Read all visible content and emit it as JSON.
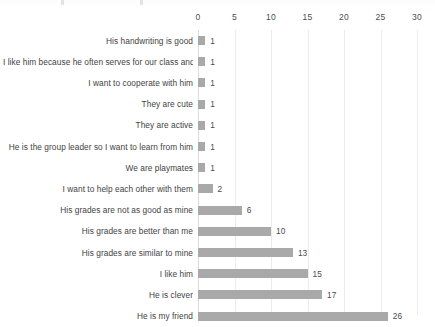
{
  "chart_data": {
    "type": "bar",
    "orientation": "horizontal",
    "title": "",
    "xlabel": "",
    "ylabel": "",
    "xlim": [
      0,
      30
    ],
    "xticks": [
      0,
      5,
      10,
      15,
      20,
      25,
      30
    ],
    "grid": true,
    "legend": false,
    "bar_color": "#a9a9a9",
    "categories": [
      "His handwriting is good",
      "I like him because he often serves for our class and…",
      "I want to cooperate with him",
      "They are cute",
      "They are active",
      "He is the group leader so I want to learn from him",
      "We are playmates",
      "I want to help each other with them",
      "His grades are not as good as mine",
      "His grades are better than me",
      "His grades are  similar to mine",
      "I like him",
      "He is clever",
      "He is my friend"
    ],
    "values": [
      1,
      1,
      1,
      1,
      1,
      1,
      1,
      2,
      6,
      10,
      13,
      15,
      17,
      26
    ],
    "data_labels": [
      "1",
      "1",
      "1",
      "1",
      "1",
      "1",
      "1",
      "2",
      "6",
      "10",
      "13",
      "15",
      "17",
      "26"
    ]
  }
}
